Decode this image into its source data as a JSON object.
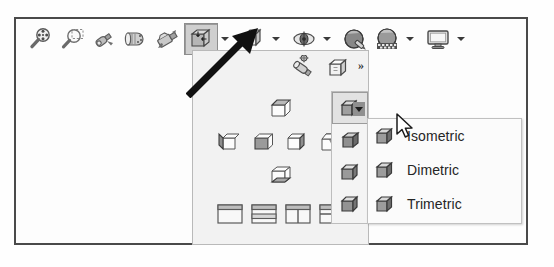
{
  "window": {
    "title": "View Toolbar",
    "background": "#fdfdfd",
    "border_color": "#4a4a4a"
  },
  "toolbar": {
    "name": "view-toolbar",
    "buttons": [
      {
        "icon": "zoom-realtime-icon",
        "label": "Zoom Realtime",
        "pressed": false,
        "has_dropdown": false
      },
      {
        "icon": "zoom-window-icon",
        "label": "Zoom Window",
        "pressed": false,
        "has_dropdown": false
      },
      {
        "icon": "pan-icon",
        "label": "Pan",
        "pressed": false,
        "has_dropdown": false
      },
      {
        "icon": "orbit-icon",
        "label": "Constrained Orbit",
        "pressed": false,
        "has_dropdown": false
      },
      {
        "icon": "named-views-icon",
        "label": "Named Views",
        "pressed": false,
        "has_dropdown": false
      },
      {
        "icon": "view-orientation-icon",
        "label": "View Orientation",
        "pressed": true,
        "has_dropdown": true
      },
      {
        "icon": "isometric-cube-icon",
        "label": "Isometric View",
        "pressed": false,
        "has_dropdown": true
      },
      {
        "icon": "camera-icon",
        "label": "Camera",
        "pressed": false,
        "has_dropdown": true
      },
      {
        "icon": "visual-style-icon",
        "label": "Visual Styles",
        "pressed": false,
        "has_dropdown": false
      },
      {
        "icon": "render-icon",
        "label": "Render",
        "pressed": false,
        "has_dropdown": true
      },
      {
        "icon": "display-icon",
        "label": "Viewports",
        "pressed": false,
        "has_dropdown": true
      }
    ]
  },
  "flyout": {
    "name": "view-orientation-flyout",
    "overflow_chevron": "»",
    "header_icons": [
      {
        "icon": "named-view-tool-icon",
        "label": "Named View"
      },
      {
        "icon": "view-manager-cube-icon",
        "label": "View Manager"
      }
    ],
    "standard_views": {
      "top": {
        "icon": "view-top-icon",
        "label": "Top"
      },
      "middle": [
        {
          "icon": "view-left-icon",
          "label": "Left"
        },
        {
          "icon": "view-front-icon",
          "label": "Front"
        },
        {
          "icon": "view-right-icon",
          "label": "Right"
        },
        {
          "icon": "view-back-icon",
          "label": "Back"
        }
      ],
      "bottom": {
        "icon": "view-bottom-icon",
        "label": "Bottom"
      }
    },
    "viewport_layouts": [
      {
        "icon": "viewport-single-icon",
        "label": "Single Viewport"
      },
      {
        "icon": "viewport-horizontal-icon",
        "label": "Two Horizontal Viewports"
      },
      {
        "icon": "viewport-vertical-icon",
        "label": "Two Vertical Viewports"
      },
      {
        "icon": "viewport-four-icon",
        "label": "Four Viewports"
      }
    ]
  },
  "iso_group": {
    "name": "isometric-views-group",
    "items": [
      {
        "icon": "cube-se-isometric-icon",
        "label": "SE Isometric",
        "active": true,
        "has_dropdown": true
      },
      {
        "icon": "cube-sw-isometric-icon",
        "label": "SW Isometric",
        "active": false,
        "has_dropdown": false
      },
      {
        "icon": "cube-ne-isometric-icon",
        "label": "NE Isometric",
        "active": false,
        "has_dropdown": false
      },
      {
        "icon": "cube-nw-isometric-icon",
        "label": "NW Isometric",
        "active": false,
        "has_dropdown": false
      }
    ]
  },
  "submenu": {
    "name": "projection-type-menu",
    "items": [
      {
        "icon": "cube-icon",
        "label": "Isometric"
      },
      {
        "icon": "cube-icon",
        "label": "Dimetric"
      },
      {
        "icon": "cube-icon",
        "label": "Trimetric"
      }
    ]
  },
  "annotations": {
    "pointer_arrow": {
      "name": "callout-arrow",
      "points_to": "view-orientation-button"
    },
    "mouse_cursor": {
      "name": "mouse-cursor",
      "over": "isometric-split-button-arrow"
    }
  },
  "colors": {
    "frame": "#4a4a4a",
    "panel_bg": "#f2f2f2",
    "menu_bg": "#fbfbfb",
    "pressed_bg": "#cfcfcf",
    "text": "#252525"
  }
}
